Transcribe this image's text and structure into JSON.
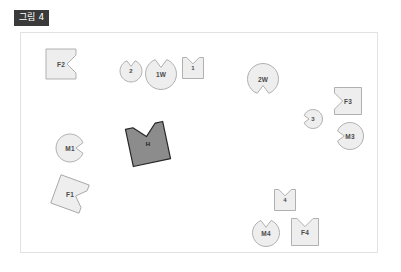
{
  "figure": {
    "caption_badge": "그림 4",
    "frame": {
      "x": 20,
      "y": 32,
      "width": 358,
      "height": 221
    },
    "colors": {
      "light_fill": "#eeeeee",
      "light_stroke": "#a8a8a8",
      "dark_fill": "#8c8c8c",
      "dark_stroke": "#262626",
      "frame_border": "#e2e2e2",
      "badge_bg": "#3a3a3a",
      "badge_text": "#ffffff",
      "label_text": "#4a4a4a",
      "background": "#ffffff"
    },
    "shapes": [
      {
        "id": "F2",
        "label": "F2",
        "kind": "square",
        "notch": "right",
        "cx": 61,
        "cy": 64,
        "size": 30,
        "rotation": 0,
        "tone": "light"
      },
      {
        "id": "2",
        "label": "2",
        "kind": "circle",
        "notch": "top",
        "cx": 131,
        "cy": 71,
        "size": 22,
        "rotation": 0,
        "tone": "light"
      },
      {
        "id": "1W",
        "label": "1W",
        "kind": "circle",
        "notch": "top",
        "cx": 161,
        "cy": 74,
        "size": 31,
        "rotation": 0,
        "tone": "light"
      },
      {
        "id": "1",
        "label": "1",
        "kind": "square",
        "notch": "top",
        "cx": 193,
        "cy": 68,
        "size": 21,
        "rotation": 0,
        "tone": "light"
      },
      {
        "id": "2W",
        "label": "2W",
        "kind": "circle",
        "notch": "bottom",
        "cx": 263,
        "cy": 79,
        "size": 31,
        "rotation": 0,
        "tone": "light"
      },
      {
        "id": "F3",
        "label": "F3",
        "kind": "square",
        "notch": "left",
        "cx": 348,
        "cy": 101,
        "size": 27,
        "rotation": 0,
        "tone": "light"
      },
      {
        "id": "3",
        "label": "3",
        "kind": "circle",
        "notch": "left",
        "cx": 313,
        "cy": 119,
        "size": 19,
        "rotation": 0,
        "tone": "light"
      },
      {
        "id": "M3",
        "label": "M3",
        "kind": "circle",
        "notch": "left",
        "cx": 350,
        "cy": 136,
        "size": 27,
        "rotation": 0,
        "tone": "light"
      },
      {
        "id": "H",
        "label": "H",
        "kind": "square",
        "notch": "top",
        "cx": 148,
        "cy": 144,
        "size": 38,
        "rotation": -12,
        "tone": "dark"
      },
      {
        "id": "M1",
        "label": "M1",
        "kind": "circle",
        "notch": "right",
        "cx": 70,
        "cy": 148,
        "size": 28,
        "rotation": 0,
        "tone": "light"
      },
      {
        "id": "F1",
        "label": "F1",
        "kind": "square",
        "notch": "right",
        "cx": 70,
        "cy": 194,
        "size": 30,
        "rotation": 20,
        "tone": "light"
      },
      {
        "id": "4",
        "label": "4",
        "kind": "square",
        "notch": "top",
        "cx": 285,
        "cy": 200,
        "size": 21,
        "rotation": 0,
        "tone": "light"
      },
      {
        "id": "M4",
        "label": "M4",
        "kind": "circle",
        "notch": "top",
        "cx": 266,
        "cy": 233,
        "size": 27,
        "rotation": 0,
        "tone": "light"
      },
      {
        "id": "F4",
        "label": "F4",
        "kind": "square",
        "notch": "top",
        "cx": 305,
        "cy": 232,
        "size": 27,
        "rotation": 0,
        "tone": "light"
      }
    ]
  }
}
